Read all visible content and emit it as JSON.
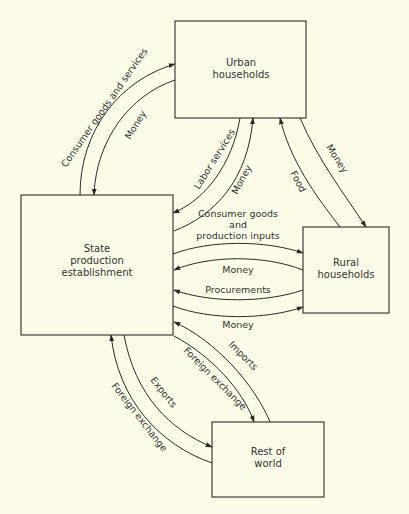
{
  "diagram": {
    "type": "flow-diagram",
    "background": "#fcfce9",
    "line_color": "#2a2a2a",
    "nodes": [
      {
        "id": "urban",
        "label_lines": [
          "Urban",
          "households"
        ]
      },
      {
        "id": "state",
        "label_lines": [
          "State",
          "production",
          "establishment"
        ]
      },
      {
        "id": "rural",
        "label_lines": [
          "Rural",
          "households"
        ]
      },
      {
        "id": "world",
        "label_lines": [
          "Rest of",
          "world"
        ]
      }
    ],
    "flows": [
      {
        "id": "f1",
        "from": "state",
        "to": "urban",
        "label": "Consumer goods and services"
      },
      {
        "id": "f2",
        "from": "urban",
        "to": "state",
        "label": "Money"
      },
      {
        "id": "f3",
        "from": "urban",
        "to": "state",
        "label": "Labor services"
      },
      {
        "id": "f4",
        "from": "state",
        "to": "urban",
        "label": "Money"
      },
      {
        "id": "f5",
        "from": "rural",
        "to": "urban",
        "label": "Food"
      },
      {
        "id": "f6",
        "from": "urban",
        "to": "rural",
        "label": "Money"
      },
      {
        "id": "f7",
        "from": "state",
        "to": "rural",
        "label_lines": [
          "Consumer goods",
          "and",
          "production inputs"
        ]
      },
      {
        "id": "f8",
        "from": "rural",
        "to": "state",
        "label": "Money"
      },
      {
        "id": "f9",
        "from": "rural",
        "to": "state",
        "label": "Procurements"
      },
      {
        "id": "f10",
        "from": "state",
        "to": "rural",
        "label": "Money"
      },
      {
        "id": "f11",
        "from": "world",
        "to": "state",
        "label": "Imports"
      },
      {
        "id": "f12",
        "from": "state",
        "to": "world",
        "label": "Foreign exchange"
      },
      {
        "id": "f13",
        "from": "state",
        "to": "world",
        "label": "Exports"
      },
      {
        "id": "f14",
        "from": "world",
        "to": "state",
        "label": "Foreign exchange"
      }
    ]
  }
}
